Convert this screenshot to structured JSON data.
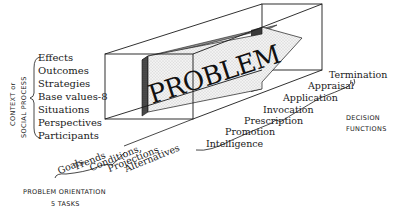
{
  "diagram": {
    "center_label": "PROBLEM",
    "context_axis": {
      "title_line1": "CONTEXT or",
      "title_line2": "SOCIAL PROCESS",
      "items": [
        "Effects",
        "Outcomes",
        "Strategies",
        "Base values-8",
        "Situations",
        "Perspectives",
        "Participants"
      ]
    },
    "orientation_axis": {
      "items": [
        "Goals",
        "Trends",
        "Conditions,",
        "Projections",
        "Alternatives"
      ],
      "title_line1": "PROBLEM ORIENTATION",
      "title_line2": "5 TASKS"
    },
    "decision_axis": {
      "items": [
        "Termination",
        "Appraisal",
        "Application",
        "Invocation",
        "Prescription",
        "Promotion",
        "Intelligence"
      ],
      "title_line1": "DECISION",
      "title_line2": "FUNCTIONS"
    },
    "colors": {
      "ink": "#1a1a1a",
      "arrow_face": "#e6e6e6",
      "arrow_side_dark": "#4a4a4a",
      "arrow_top": "#9a9a9a"
    }
  }
}
